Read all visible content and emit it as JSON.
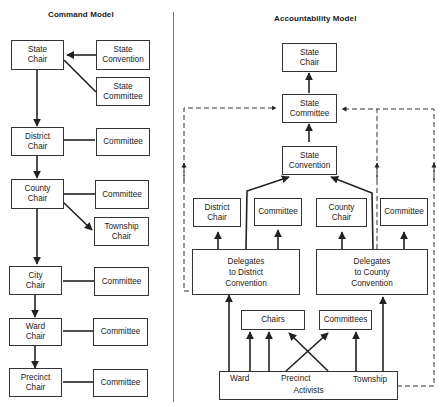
{
  "command_model": {
    "title": "Command Model",
    "nodes": {
      "state_chair": "State\nChair",
      "state_convention": "State\nConvention",
      "state_committee": "State\nCommittee",
      "district_chair": "District\nChair",
      "district_committee": "Committee",
      "county_chair": "County\nChair",
      "county_committee": "Committee",
      "township_chair": "Township\nChair",
      "city_chair": "City\nChair",
      "city_committee": "Committee",
      "ward_chair": "Ward\nChair",
      "ward_committee": "Committee",
      "precinct_chair": "Precinct\nChair",
      "precinct_committee": "Committee"
    },
    "edges": [
      {
        "from": "state_convention",
        "to": "state_chair",
        "type": "arrow"
      },
      {
        "from": "state_committee",
        "to": "state_chair",
        "type": "line"
      },
      {
        "from": "state_chair",
        "to": "district_chair",
        "type": "arrow"
      },
      {
        "from": "district_chair",
        "to": "district_committee",
        "type": "line"
      },
      {
        "from": "district_chair",
        "to": "county_chair",
        "type": "arrow"
      },
      {
        "from": "county_chair",
        "to": "county_committee",
        "type": "line"
      },
      {
        "from": "county_chair",
        "to": "township_chair",
        "type": "arrow"
      },
      {
        "from": "county_chair",
        "to": "city_chair",
        "type": "arrow"
      },
      {
        "from": "city_chair",
        "to": "city_committee",
        "type": "line"
      },
      {
        "from": "city_chair",
        "to": "ward_chair",
        "type": "arrow"
      },
      {
        "from": "ward_chair",
        "to": "ward_committee",
        "type": "line"
      },
      {
        "from": "ward_chair",
        "to": "precinct_chair",
        "type": "arrow"
      },
      {
        "from": "precinct_chair",
        "to": "precinct_committee",
        "type": "line"
      }
    ]
  },
  "accountability_model": {
    "title": "Accountability Model",
    "nodes": {
      "state_chair": "State\nChair",
      "state_committee": "State\nCommittee",
      "state_convention": "State\nConvention",
      "district_chair": "District\nChair",
      "district_committee": "Committee",
      "county_chair": "County\nChair",
      "county_committee": "Committee",
      "delegates_district": "Delegates\nto District\nConvention",
      "delegates_county": "Delegates\nto County\nConvention",
      "chairs": "Chairs",
      "committees": "Committees",
      "activists": "Activists",
      "ward": "Ward",
      "precinct": "Precinct",
      "township": "Township"
    },
    "edges": [
      {
        "from": "state_committee",
        "to": "state_chair",
        "type": "arrow"
      },
      {
        "from": "state_convention",
        "to": "state_committee",
        "type": "arrow"
      },
      {
        "from": "delegates_district",
        "to": "state_convention",
        "type": "arrow"
      },
      {
        "from": "delegates_county",
        "to": "state_convention",
        "type": "arrow"
      },
      {
        "from": "delegates_district",
        "to": "district_chair",
        "type": "arrow"
      },
      {
        "from": "delegates_district",
        "to": "district_committee",
        "type": "arrow"
      },
      {
        "from": "delegates_county",
        "to": "county_chair",
        "type": "arrow"
      },
      {
        "from": "delegates_county",
        "to": "county_committee",
        "type": "arrow"
      },
      {
        "from": "delegates_district",
        "to": "state_committee",
        "type": "dashed-arrow"
      },
      {
        "from": "delegates_county",
        "to": "state_committee",
        "type": "dashed-arrow"
      },
      {
        "from": "activists",
        "to": "state_committee",
        "type": "dashed-arrow"
      },
      {
        "from": "ward",
        "to": "delegates_district",
        "type": "arrow"
      },
      {
        "from": "ward",
        "to": "chairs",
        "type": "arrow"
      },
      {
        "from": "precinct",
        "to": "chairs",
        "type": "arrow"
      },
      {
        "from": "precinct",
        "to": "committees",
        "type": "arrow"
      },
      {
        "from": "township",
        "to": "committees",
        "type": "arrow"
      },
      {
        "from": "township",
        "to": "delegates_county",
        "type": "arrow"
      }
    ]
  }
}
